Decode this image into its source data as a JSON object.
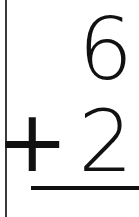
{
  "card": {
    "type": "arithmetic-flashcard",
    "operation": "addition",
    "background_color": "#ffffff",
    "ink_color": "#111111",
    "edge_rule_color": "#3a3a3a"
  },
  "problem": {
    "first_operand": "6",
    "operator": "+",
    "second_operand": "2",
    "answer": "",
    "answer_placeholder": ""
  },
  "rules": {
    "sum_bar_label": "sum-rule",
    "edge_label": "card-edge-rule"
  }
}
